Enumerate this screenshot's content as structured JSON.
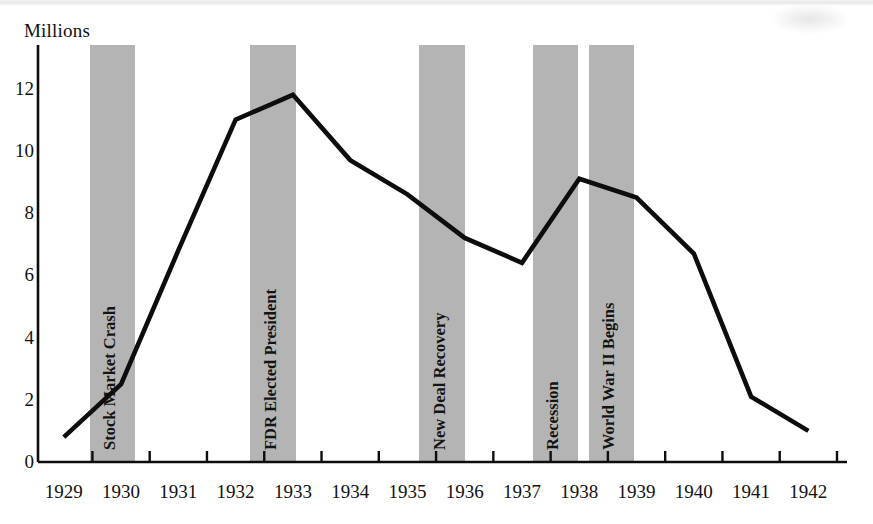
{
  "chart_data": {
    "type": "line",
    "title": "",
    "ylabel": "Millions",
    "xlabel": "",
    "ylim": [
      0,
      13.4
    ],
    "yticks": [
      0,
      2,
      4,
      6,
      8,
      10,
      12
    ],
    "ytick_labels": [
      "0",
      "2",
      "4",
      "6",
      "8",
      "10",
      "12"
    ],
    "grid": false,
    "legend": "none",
    "categories": [
      "1929",
      "1930",
      "1931",
      "1932",
      "1933",
      "1934",
      "1935",
      "1936",
      "1937",
      "1938",
      "1939",
      "1940",
      "1941",
      "1942"
    ],
    "x": [
      1929,
      1930,
      1931,
      1932,
      1933,
      1934,
      1935,
      1936,
      1937,
      1938,
      1939,
      1940,
      1941,
      1942
    ],
    "values": [
      0.8,
      2.5,
      6.8,
      11.0,
      11.8,
      9.7,
      8.6,
      7.2,
      6.4,
      9.1,
      8.5,
      6.7,
      2.1,
      1.0
    ],
    "series": [
      {
        "name": "Unemployment",
        "values": [
          0.8,
          2.5,
          6.8,
          11.0,
          11.8,
          9.7,
          8.6,
          7.2,
          6.4,
          9.1,
          8.5,
          6.7,
          2.1,
          1.0
        ]
      }
    ],
    "annotations": [
      {
        "label": "Stock Market Crash",
        "x_start": 1929.45,
        "x_end": 1930.25
      },
      {
        "label": "FDR Elected President",
        "x_start": 1932.25,
        "x_end": 1933.05
      },
      {
        "label": "New Deal Recovery",
        "x_start": 1935.2,
        "x_end": 1936.0
      },
      {
        "label": "Recession",
        "x_start": 1937.2,
        "x_end": 1937.97
      },
      {
        "label": "World War II Begins",
        "x_start": 1938.17,
        "x_end": 1938.95
      }
    ],
    "line_color": "#0d0d0d",
    "band_color": "#b4b4b4",
    "axis_color": "#0d0d0d"
  }
}
